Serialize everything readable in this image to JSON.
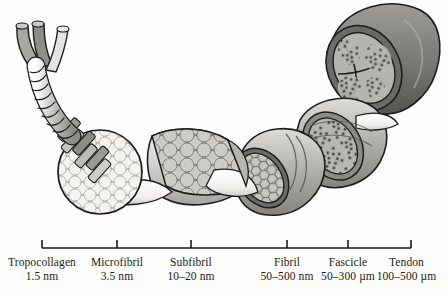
{
  "figure": {
    "background_color": "#fdfdfc",
    "ink_color": "#1a1a1a"
  },
  "scale_bar": {
    "axis_color": "#1a1a1a",
    "x_start": 42,
    "x_end": 411,
    "y": 248,
    "ticks": [
      42,
      117,
      191,
      287,
      348,
      411
    ]
  },
  "levels": [
    {
      "id": "tropocollagen",
      "name": "Tropocollagen",
      "size": "1.5 nm",
      "tick_x": 42,
      "label_center_x": 42,
      "icon": "triple-helix-rope",
      "description": "Three-stranded coiled rope with splayed strand ends"
    },
    {
      "id": "microfibril",
      "name": "Microfibril",
      "size": "3.5 nm",
      "tick_x": 117,
      "label_center_x": 117,
      "icon": "circle-packed-cross-section",
      "description": "Round cross-section packed with pale circles; staggered rod array entering"
    },
    {
      "id": "subfibril",
      "name": "Subfibril",
      "size": "10–20 nm",
      "tick_x": 191,
      "label_center_x": 191,
      "icon": "tapered-cylinder-large-circles",
      "description": "Tapered cylinder with large gray circles on the cut face"
    },
    {
      "id": "fibril",
      "name": "Fibril",
      "size": "50–500 nm",
      "tick_x": 287,
      "label_center_x": 287,
      "icon": "honeycomb-cross-section",
      "description": "Banded cylinder with dense hexagonal honeycomb packing on cut face"
    },
    {
      "id": "fascicle",
      "name": "Fascicle",
      "size": "50–300 µm",
      "tick_x": 348,
      "label_center_x": 348,
      "icon": "granular-bundle-cross-section",
      "description": "Cut face showing clustered granular fibril bundles"
    },
    {
      "id": "tendon",
      "name": "Tendon",
      "size": "100–500 µm",
      "tick_x": 411,
      "label_center_x": 411,
      "icon": "dark-cylinder-compartments",
      "description": "Dark gray cylinder, cut end divided into compartments by septa"
    }
  ],
  "palette": {
    "outline": "#1d1d1d",
    "rope_light": "#efeeec",
    "rope_mid": "#b9b7b3",
    "rope_dark": "#8b8986",
    "fill_pale": "#f2f1ee",
    "fill_light": "#dcdad6",
    "fill_mid": "#b4b2ad",
    "fill_dark": "#8d8b86",
    "fill_darker": "#6f6d69",
    "tendon_gray": "#7c7a76",
    "tendon_gray_dark": "#5f5d59",
    "cone_white": "#ffffff"
  }
}
